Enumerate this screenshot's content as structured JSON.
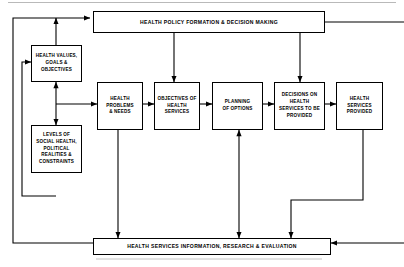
{
  "diagram": {
    "type": "flowchart",
    "colors": {
      "line": "#000000",
      "box_fill": "#ffffff",
      "text": "#000000",
      "background": "#ffffff"
    },
    "nodes": {
      "policy": {
        "id": "health-policy-formation",
        "label": "HEALTH POLICY FORMATION & DECISION MAKING",
        "shape": "bar"
      },
      "values": {
        "id": "health-values-goals-objectives",
        "label": "HEALTH VALUES,\nGOALS &\nOBJECTIVES",
        "shape": "box"
      },
      "levels": {
        "id": "levels-of-social-health",
        "label": "LEVELS OF\nSOCIAL HEALTH,\nPOLITICAL\nREALITIES &\nCONSTRAINTS",
        "shape": "box"
      },
      "problems": {
        "id": "health-problems-needs",
        "label": "HEALTH\nPROBLEMS\n& NEEDS",
        "shape": "box"
      },
      "objectives": {
        "id": "objectives-of-health-services",
        "label": "OBJECTIVES OF\nHEALTH\nSERVICES",
        "shape": "box"
      },
      "planning": {
        "id": "planning-of-options",
        "label": "PLANNING\nOF OPTIONS",
        "shape": "box"
      },
      "decisions": {
        "id": "decisions-on-health-services",
        "label": "DECISIONS ON\nHEALTH\nSERVICES TO BE\nPROVIDED",
        "shape": "box"
      },
      "provided": {
        "id": "health-services-provided",
        "label": "HEALTH\nSERVICES\nPROVIDED",
        "shape": "box"
      },
      "information": {
        "id": "health-services-information",
        "label": "HEALTH  SERVICES INFORMATION, RESEARCH & EVALUATION",
        "shape": "bar"
      }
    },
    "edges": [
      {
        "from": "health-policy-formation",
        "to": "objectives-of-health-services",
        "direction": "one-way"
      },
      {
        "from": "health-policy-formation",
        "to": "decisions-on-health-services",
        "direction": "one-way"
      },
      {
        "from": "health-values-goals-objectives",
        "to": "health-policy-formation",
        "direction": "one-way"
      },
      {
        "from": "health-values-goals-objectives",
        "to": "levels-of-social-health",
        "direction": "two-way"
      },
      {
        "from": "levels-of-social-health",
        "to": "health-problems-needs",
        "direction": "one-way"
      },
      {
        "from": "health-problems-needs",
        "to": "objectives-of-health-services",
        "direction": "one-way"
      },
      {
        "from": "objectives-of-health-services",
        "to": "planning-of-options",
        "direction": "one-way"
      },
      {
        "from": "planning-of-options",
        "to": "decisions-on-health-services",
        "direction": "one-way"
      },
      {
        "from": "decisions-on-health-services",
        "to": "health-services-provided",
        "direction": "one-way"
      },
      {
        "from": "health-problems-needs",
        "to": "health-services-information",
        "direction": "one-way"
      },
      {
        "from": "planning-of-options",
        "to": "health-services-information",
        "direction": "two-way"
      },
      {
        "from": "health-services-provided",
        "to": "health-services-information",
        "direction": "one-way"
      },
      {
        "from": "health-services-information",
        "to": "health-policy-formation",
        "direction": "one-way"
      },
      {
        "from": "health-services-information",
        "to": "health-values-goals-objectives",
        "direction": "one-way"
      },
      {
        "from": "external-right",
        "to": "health-services-information",
        "direction": "one-way"
      },
      {
        "from": "health-policy-formation",
        "to": "external-right",
        "direction": "one-way"
      }
    ]
  }
}
